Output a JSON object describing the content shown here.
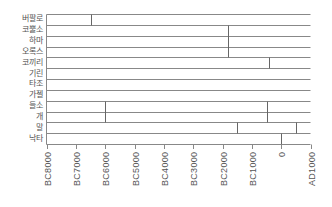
{
  "chart_data": {
    "type": "timeline",
    "title": "",
    "xlabel": "",
    "ylabel": "",
    "x_axis": {
      "min": -8000,
      "max": 1000,
      "ticks": [
        -8000,
        -7000,
        -6000,
        -5000,
        -4000,
        -3000,
        -2000,
        -1000,
        0,
        1000
      ],
      "tick_labels": [
        "BC8000",
        "BC7000",
        "BC6000",
        "BC5000",
        "BC4000",
        "BC3000",
        "BC2000",
        "BC1000",
        "0",
        "AD1000"
      ]
    },
    "rows": [
      "버팔로",
      "코뿔소",
      "하마",
      "오록스",
      "코끼리",
      "기린",
      "타조",
      "가젤",
      "들소",
      "개",
      "말",
      "낙타"
    ],
    "markers": [
      {
        "rows": [
          0
        ],
        "labels": [
          "버팔로"
        ],
        "x": -6500
      },
      {
        "rows": [
          1,
          2,
          3
        ],
        "labels": [
          "코뿔소",
          "하마",
          "오록스"
        ],
        "x": -1800
      },
      {
        "rows": [
          4
        ],
        "labels": [
          "코끼리"
        ],
        "x": -400
      },
      {
        "rows": [
          8,
          9
        ],
        "labels": [
          "들소",
          "개"
        ],
        "x": -6000
      },
      {
        "rows": [
          8,
          9
        ],
        "labels": [
          "들소",
          "개"
        ],
        "x": -500
      },
      {
        "rows": [
          10
        ],
        "labels": [
          "말"
        ],
        "x": -1500
      },
      {
        "rows": [
          10
        ],
        "labels": [
          "말"
        ],
        "x": 500
      },
      {
        "rows": [
          11
        ],
        "labels": [
          "낙타"
        ],
        "x": 0
      }
    ],
    "grid": false,
    "legend": null
  },
  "style": {
    "line_color": "#888888",
    "marker_color": "#666666",
    "text_color": "#555555"
  }
}
